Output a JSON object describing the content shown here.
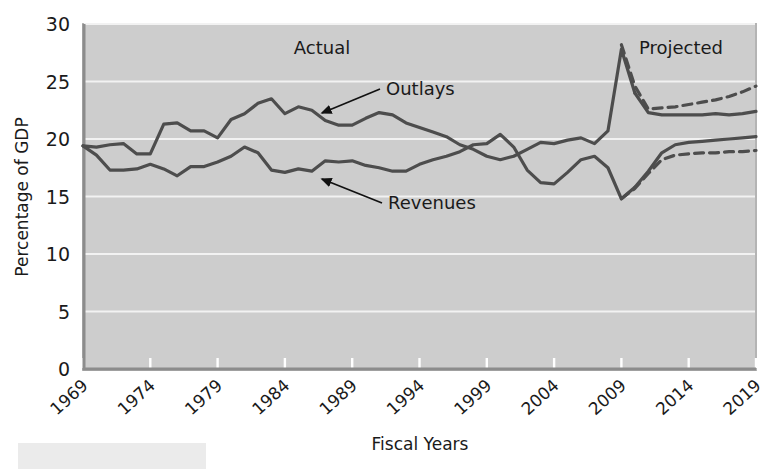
{
  "chart_data": {
    "type": "line",
    "title": "",
    "xlabel": "Fiscal Years",
    "ylabel": "Percentage of GDP",
    "xlim": [
      1969,
      2019
    ],
    "ylim": [
      0,
      30
    ],
    "yticks": [
      0,
      5,
      10,
      15,
      20,
      25,
      30
    ],
    "xticks": [
      1969,
      1974,
      1979,
      1984,
      1989,
      1994,
      1999,
      2004,
      2009,
      2014,
      2019
    ],
    "grid": "horizontal-white",
    "legend_position": "inline-annotations",
    "annotations": [
      {
        "text": "Actual",
        "x": 1989,
        "y": 28.0
      },
      {
        "text": "Projected",
        "x": 2015,
        "y": 28.0
      },
      {
        "text": "Outlays",
        "x": 1992,
        "y": 25.2,
        "arrow_to_x": 1986.5,
        "arrow_to_y": 22.8
      },
      {
        "text": "Revenues",
        "x": 1992,
        "y": 16.2,
        "arrow_to_x": 1986.5,
        "arrow_to_y": 17.8
      }
    ],
    "series": [
      {
        "name": "Outlays",
        "style": "solid",
        "phase": "actual",
        "x": [
          1969,
          1970,
          1971,
          1972,
          1973,
          1974,
          1975,
          1976,
          1977,
          1978,
          1979,
          1980,
          1981,
          1982,
          1983,
          1984,
          1985,
          1986,
          1987,
          1988,
          1989,
          1990,
          1991,
          1992,
          1993,
          1994,
          1995,
          1996,
          1997,
          1998,
          1999,
          2000,
          2001,
          2002,
          2003,
          2004,
          2005,
          2006,
          2007,
          2008,
          2009,
          2010
        ],
        "values": [
          19.4,
          19.3,
          19.5,
          19.6,
          18.7,
          18.7,
          21.3,
          21.4,
          20.7,
          20.7,
          20.1,
          21.7,
          22.2,
          23.1,
          23.5,
          22.2,
          22.8,
          22.5,
          21.6,
          21.2,
          21.2,
          21.8,
          22.3,
          22.1,
          21.4,
          21.0,
          20.6,
          20.2,
          19.5,
          19.1,
          18.5,
          18.2,
          18.5,
          19.1,
          19.7,
          19.6,
          19.9,
          20.1,
          19.6,
          20.7,
          27.8,
          24.0
        ]
      },
      {
        "name": "Outlays",
        "style": "solid",
        "phase": "projected",
        "x": [
          2010,
          2011,
          2012,
          2013,
          2014,
          2015,
          2016,
          2017,
          2018,
          2019
        ],
        "values": [
          24.0,
          22.3,
          22.1,
          22.1,
          22.1,
          22.1,
          22.2,
          22.1,
          22.2,
          22.4
        ]
      },
      {
        "name": "Outlays",
        "style": "dashed",
        "phase": "projected-alternative",
        "x": [
          2009,
          2010,
          2011,
          2012,
          2013,
          2014,
          2015,
          2016,
          2017,
          2018,
          2019
        ],
        "values": [
          28.2,
          24.6,
          22.6,
          22.7,
          22.8,
          23.0,
          23.2,
          23.4,
          23.7,
          24.1,
          24.6
        ]
      },
      {
        "name": "Revenues",
        "style": "solid",
        "phase": "actual",
        "x": [
          1969,
          1970,
          1971,
          1972,
          1973,
          1974,
          1975,
          1976,
          1977,
          1978,
          1979,
          1980,
          1981,
          1982,
          1983,
          1984,
          1985,
          1986,
          1987,
          1988,
          1989,
          1990,
          1991,
          1992,
          1993,
          1994,
          1995,
          1996,
          1997,
          1998,
          1999,
          2000,
          2001,
          2002,
          2003,
          2004,
          2005,
          2006,
          2007,
          2008,
          2009,
          2010
        ],
        "values": [
          19.4,
          18.6,
          17.3,
          17.3,
          17.4,
          17.8,
          17.4,
          16.8,
          17.6,
          17.6,
          18.0,
          18.5,
          19.3,
          18.8,
          17.3,
          17.1,
          17.4,
          17.2,
          18.1,
          18.0,
          18.1,
          17.7,
          17.5,
          17.2,
          17.2,
          17.8,
          18.2,
          18.5,
          18.9,
          19.5,
          19.6,
          20.4,
          19.3,
          17.3,
          16.2,
          16.1,
          17.1,
          18.2,
          18.5,
          17.5,
          14.8,
          15.8
        ]
      },
      {
        "name": "Revenues",
        "style": "solid",
        "phase": "projected",
        "x": [
          2010,
          2011,
          2012,
          2013,
          2014,
          2015,
          2016,
          2017,
          2018,
          2019
        ],
        "values": [
          15.8,
          17.2,
          18.8,
          19.5,
          19.7,
          19.8,
          19.9,
          20.0,
          20.1,
          20.2
        ]
      },
      {
        "name": "Revenues",
        "style": "dashed",
        "phase": "projected-alternative",
        "x": [
          2009,
          2010,
          2011,
          2012,
          2013,
          2014,
          2015,
          2016,
          2017,
          2018,
          2019
        ],
        "values": [
          14.8,
          15.7,
          17.0,
          18.2,
          18.6,
          18.7,
          18.8,
          18.8,
          18.9,
          18.9,
          19.0
        ]
      }
    ]
  },
  "axis": {
    "y_title": "Percentage of GDP",
    "x_title": "Fiscal Years",
    "y_ticks": [
      "0",
      "5",
      "10",
      "15",
      "20",
      "25",
      "30"
    ],
    "x_ticks": [
      "1969",
      "1974",
      "1979",
      "1984",
      "1989",
      "1994",
      "1999",
      "2004",
      "2009",
      "2014",
      "2019"
    ]
  },
  "annotations": {
    "actual": "Actual",
    "projected": "Projected",
    "outlays": "Outlays",
    "revenues": "Revenues"
  },
  "colors": {
    "plot_background": "#cdcdcd",
    "gridline": "#f2f2f2",
    "line": "#4d4d4d",
    "text": "#1a1a1a",
    "footer_box": "#ebebeb"
  }
}
